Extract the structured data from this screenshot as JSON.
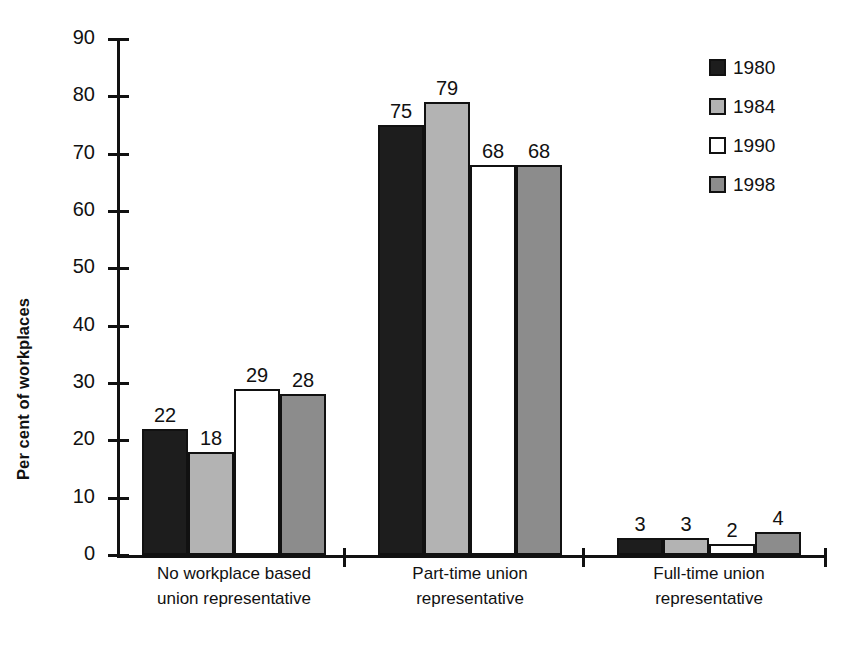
{
  "chart_data": {
    "type": "bar",
    "title": "",
    "xlabel": "",
    "ylabel": "Per cent of workplaces",
    "ylim": [
      0,
      90
    ],
    "ytick_step": 10,
    "grid": false,
    "legend_position": "top-right",
    "categories": [
      "No workplace based union representative",
      "Part-time union representative",
      "Full-time union representative"
    ],
    "category_lines": [
      [
        "No workplace based",
        "union representative"
      ],
      [
        "Part-time union",
        "representative"
      ],
      [
        "Full-time union",
        "representative"
      ]
    ],
    "ytick_labels": [
      "90",
      "80",
      "70",
      "60",
      "50",
      "40",
      "30",
      "20",
      "10",
      "0"
    ],
    "ytick_values": [
      90,
      80,
      70,
      60,
      50,
      40,
      30,
      20,
      10,
      0
    ],
    "series": [
      {
        "name": "1980",
        "color": "#1d1d1d",
        "values": [
          22,
          75,
          3
        ]
      },
      {
        "name": "1984",
        "color": "#b3b3b3",
        "values": [
          18,
          79,
          3
        ]
      },
      {
        "name": "1990",
        "color": "#ffffff",
        "values": [
          29,
          68,
          2
        ]
      },
      {
        "name": "1998",
        "color": "#8c8c8c",
        "values": [
          28,
          68,
          4
        ]
      }
    ]
  },
  "legend": {
    "items": [
      {
        "label": "1980",
        "swatch": "black-swatch-icon"
      },
      {
        "label": "1984",
        "swatch": "light-gray-swatch-icon"
      },
      {
        "label": "1990",
        "swatch": "white-swatch-icon"
      },
      {
        "label": "1998",
        "swatch": "medium-gray-swatch-icon"
      }
    ]
  },
  "axis": {
    "y_title": "Per cent of workplaces"
  }
}
